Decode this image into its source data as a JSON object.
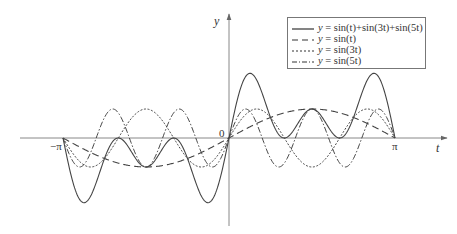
{
  "chart_data": {
    "type": "line",
    "title": "",
    "xlabel": "t",
    "ylabel": "y",
    "origin_label": "0",
    "xticks": [
      {
        "value": -3.14159,
        "label": "−π"
      },
      {
        "value": 3.14159,
        "label": "π"
      }
    ],
    "xlim": [
      -3.14159,
      3.14159
    ],
    "ylim": [
      -2.15,
      2.15
    ],
    "grid": false,
    "legend_position": "upper right",
    "x_step": "π/20",
    "x": [
      -3.1416,
      -2.9845,
      -2.8274,
      -2.6704,
      -2.5133,
      -2.3562,
      -2.1991,
      -2.042,
      -1.885,
      -1.7279,
      -1.5708,
      -1.4137,
      -1.2566,
      -1.0996,
      -0.9425,
      -0.7854,
      -0.6283,
      -0.4712,
      -0.3142,
      -0.1571,
      0,
      0.1571,
      0.3142,
      0.4712,
      0.6283,
      0.7854,
      0.9425,
      1.0996,
      1.2566,
      1.4137,
      1.5708,
      1.7279,
      1.885,
      2.042,
      2.1991,
      2.3562,
      2.5133,
      2.6704,
      2.8274,
      2.9845,
      3.1416
    ],
    "series": [
      {
        "name": "y = sin(t)+sin(3t)+sin(5t)",
        "style": "solid",
        "freqs": [
          1,
          3,
          5
        ],
        "values": [
          0,
          -1.3175,
          -2.118,
          -2.1488,
          -1.5389,
          -0.7071,
          -0.118,
          -0.0139,
          -0.3633,
          -0.8044,
          -1,
          -0.8044,
          -0.3633,
          -0.0139,
          -0.118,
          -0.7071,
          -1.5389,
          -2.1488,
          -2.118,
          -1.3175,
          0,
          1.3175,
          2.118,
          2.1488,
          1.5389,
          0.7071,
          0.118,
          0.0139,
          0.3633,
          0.8044,
          1,
          0.8044,
          0.3633,
          0.0139,
          0.118,
          0.7071,
          1.5389,
          2.1488,
          2.118,
          1.3175,
          0
        ]
      },
      {
        "name": "y = sin(t)",
        "style": "dashed",
        "freqs": [
          1
        ],
        "values": [
          0,
          -0.1564,
          -0.309,
          -0.454,
          -0.5878,
          -0.7071,
          -0.809,
          -0.891,
          -0.9511,
          -0.9877,
          -1,
          -0.9877,
          -0.9511,
          -0.891,
          -0.809,
          -0.7071,
          -0.5878,
          -0.454,
          -0.309,
          -0.1564,
          0,
          0.1564,
          0.309,
          0.454,
          0.5878,
          0.7071,
          0.809,
          0.891,
          0.9511,
          0.9877,
          1,
          0.9877,
          0.9511,
          0.891,
          0.809,
          0.7071,
          0.5878,
          0.454,
          0.309,
          0.1564,
          0
        ]
      },
      {
        "name": "y = sin(3t)",
        "style": "dotted",
        "freqs": [
          3
        ],
        "values": [
          0,
          -0.454,
          -0.809,
          -0.9877,
          -0.9511,
          -0.7071,
          -0.309,
          0.1564,
          0.5878,
          0.891,
          1,
          0.891,
          0.5878,
          0.1564,
          -0.309,
          -0.7071,
          -0.9511,
          -0.9877,
          -0.809,
          -0.454,
          0,
          0.454,
          0.809,
          0.9877,
          0.9511,
          0.7071,
          0.309,
          -0.1564,
          -0.5878,
          -0.891,
          -1,
          -0.891,
          -0.5878,
          -0.1564,
          0.309,
          0.7071,
          0.9511,
          0.9877,
          0.809,
          0.454,
          0
        ]
      },
      {
        "name": "y = sin(5t)",
        "style": "dashdot",
        "freqs": [
          5
        ],
        "values": [
          0,
          -0.7071,
          -1,
          -0.7071,
          0,
          0.7071,
          1,
          0.7071,
          0,
          -0.7071,
          -1,
          -0.7071,
          0,
          0.7071,
          1,
          0.7071,
          0,
          -0.7071,
          -1,
          -0.7071,
          0,
          0.7071,
          1,
          0.7071,
          0,
          -0.7071,
          -1,
          -0.7071,
          0,
          0.7071,
          1,
          0.7071,
          0,
          -0.7071,
          -1,
          -0.7071,
          0,
          0.7071,
          1,
          0.7071,
          0
        ]
      }
    ]
  },
  "legend": {
    "items": [
      {
        "prefix": "y",
        "text": " = sin(t)+sin(3t)+sin(5t)"
      },
      {
        "prefix": "y",
        "text": " = sin(t)"
      },
      {
        "prefix": "y",
        "text": " = sin(3t)"
      },
      {
        "prefix": "y",
        "text": " = sin(5t)"
      }
    ]
  },
  "colors": {
    "axis": "#888888",
    "curve": "#444444",
    "legend_border": "#777777"
  }
}
